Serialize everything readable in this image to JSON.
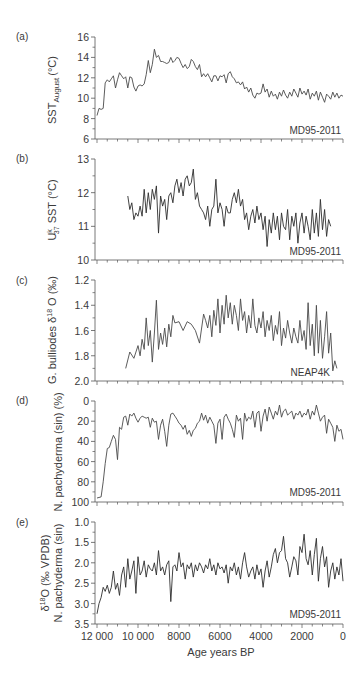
{
  "figure": {
    "xlabel": "Age years BP",
    "x_ticks": [
      12000,
      10000,
      8000,
      6000,
      4000,
      2000,
      0
    ],
    "x_tick_labels": [
      "12 000",
      "10 000",
      "8000",
      "6000",
      "4000",
      "2000",
      "0"
    ],
    "line_color": "#4a4a4a"
  },
  "chart_data": [
    {
      "type": "line",
      "panel": "(a)",
      "title": "",
      "ylabel": "SST August (°C)",
      "ylabel_main": "SST",
      "ylabel_sub": "August",
      "ylabel_unit": "(°C)",
      "core": "MD95-2011",
      "ylim": [
        6,
        16
      ],
      "y_ticks": [
        6,
        8,
        10,
        12,
        14,
        16
      ],
      "y_tick_labels": [
        "6",
        "8",
        "10",
        "12",
        "14",
        "16"
      ],
      "inverted": false,
      "x": [
        12000,
        11900,
        11800,
        11700,
        11600,
        11500,
        11400,
        11300,
        11200,
        11100,
        11000,
        10900,
        10800,
        10700,
        10600,
        10500,
        10400,
        10300,
        10200,
        10100,
        10000,
        9900,
        9800,
        9700,
        9600,
        9500,
        9400,
        9300,
        9200,
        9100,
        9000,
        8900,
        8800,
        8700,
        8600,
        8500,
        8400,
        8300,
        8200,
        8100,
        8000,
        7900,
        7800,
        7700,
        7600,
        7500,
        7400,
        7300,
        7200,
        7100,
        7000,
        6900,
        6800,
        6700,
        6600,
        6500,
        6400,
        6300,
        6200,
        6100,
        6000,
        5900,
        5800,
        5700,
        5600,
        5500,
        5400,
        5300,
        5200,
        5100,
        5000,
        4900,
        4800,
        4700,
        4600,
        4500,
        4400,
        4300,
        4200,
        4100,
        4000,
        3900,
        3800,
        3700,
        3600,
        3500,
        3400,
        3300,
        3200,
        3100,
        3000,
        2900,
        2800,
        2700,
        2600,
        2500,
        2400,
        2300,
        2200,
        2100,
        2000,
        1900,
        1800,
        1700,
        1600,
        1500,
        1400,
        1300,
        1200,
        1100,
        1000,
        900,
        800,
        700,
        600,
        500,
        400,
        300,
        200,
        100,
        0
      ],
      "values": [
        8.3,
        9.0,
        8.9,
        9.0,
        11.5,
        11.8,
        11.6,
        11.9,
        12.2,
        11.0,
        11.8,
        12.5,
        12.2,
        11.9,
        12.1,
        11.0,
        12.1,
        12.0,
        11.1,
        10.7,
        11.2,
        11.3,
        11.2,
        11.4,
        12.3,
        13.7,
        12.5,
        13.3,
        14.8,
        14.0,
        14.2,
        13.6,
        13.6,
        13.5,
        13.4,
        13.5,
        14.0,
        13.5,
        13.7,
        14.0,
        13.9,
        13.4,
        13.0,
        13.3,
        12.9,
        13.1,
        13.8,
        13.6,
        13.1,
        12.8,
        13.3,
        12.1,
        12.4,
        12.1,
        12.4,
        12.0,
        11.6,
        12.2,
        12.2,
        11.7,
        12.2,
        12.1,
        12.3,
        11.5,
        12.4,
        12.6,
        12.1,
        11.9,
        11.5,
        11.6,
        11.3,
        11.6,
        10.9,
        11.1,
        10.6,
        11.0,
        10.3,
        10.0,
        10.5,
        10.4,
        10.5,
        11.4,
        10.6,
        10.9,
        10.1,
        10.7,
        10.2,
        10.4,
        9.9,
        10.6,
        10.2,
        10.8,
        10.3,
        10.0,
        10.6,
        10.2,
        10.9,
        10.5,
        10.1,
        11.0,
        10.4,
        10.7,
        10.3,
        10.9,
        9.9,
        10.5,
        10.2,
        10.7,
        9.8,
        10.6,
        10.1,
        9.6,
        10.4,
        10.2,
        9.9,
        10.6,
        10.1,
        10.5,
        10.0,
        10.3,
        10.2
      ]
    },
    {
      "type": "line",
      "panel": "(b)",
      "title": "",
      "ylabel": "Uk37 SST (°C)",
      "ylabel_main": "U",
      "ylabel_sup": "k",
      "ylabel_sub": "37",
      "ylabel_rest": " SST (°C)",
      "core": "MD95-2011",
      "ylim": [
        10,
        13
      ],
      "y_ticks": [
        10,
        11,
        12,
        13
      ],
      "y_tick_labels": [
        "10",
        "11",
        "12",
        "13"
      ],
      "inverted": false,
      "x": [
        10500,
        10400,
        10300,
        10200,
        10100,
        10000,
        9900,
        9800,
        9700,
        9600,
        9500,
        9400,
        9300,
        9200,
        9100,
        9000,
        8900,
        8800,
        8700,
        8600,
        8500,
        8400,
        8300,
        8200,
        8100,
        8000,
        7900,
        7800,
        7700,
        7600,
        7500,
        7400,
        7300,
        7200,
        7100,
        7000,
        6900,
        6800,
        6700,
        6600,
        6500,
        6400,
        6300,
        6200,
        6100,
        6000,
        5900,
        5800,
        5700,
        5600,
        5500,
        5400,
        5300,
        5200,
        5100,
        5000,
        4900,
        4800,
        4700,
        4600,
        4500,
        4400,
        4300,
        4200,
        4100,
        4000,
        3900,
        3800,
        3700,
        3600,
        3500,
        3400,
        3300,
        3200,
        3100,
        3000,
        2900,
        2800,
        2700,
        2600,
        2500,
        2400,
        2300,
        2200,
        2100,
        2000,
        1900,
        1800,
        1700,
        1600,
        1500,
        1400,
        1300,
        1200,
        1100,
        1000,
        900,
        800,
        700,
        600
      ],
      "values": [
        11.9,
        11.5,
        11.7,
        11.2,
        11.4,
        11.3,
        11.6,
        11.3,
        12.1,
        11.4,
        12.0,
        11.5,
        12.1,
        11.8,
        12.2,
        10.8,
        11.9,
        11.6,
        11.8,
        11.2,
        11.9,
        12.0,
        11.7,
        12.2,
        12.4,
        12.0,
        12.3,
        11.9,
        12.4,
        12.5,
        12.2,
        12.3,
        12.7,
        11.8,
        12.0,
        11.6,
        11.5,
        11.4,
        11.2,
        11.6,
        11.0,
        11.5,
        11.6,
        12.4,
        11.4,
        11.7,
        11.5,
        11.0,
        11.6,
        11.4,
        11.4,
        11.8,
        12.0,
        11.7,
        12.1,
        11.6,
        11.8,
        11.2,
        11.4,
        10.9,
        11.3,
        11.5,
        11.1,
        11.6,
        11.2,
        11.4,
        10.9,
        11.3,
        10.4,
        11.2,
        10.8,
        11.4,
        10.9,
        11.3,
        10.6,
        11.4,
        11.0,
        10.9,
        11.5,
        10.6,
        11.3,
        11.0,
        11.4,
        10.5,
        11.1,
        11.4,
        10.8,
        11.3,
        11.0,
        10.6,
        11.5,
        10.8,
        11.4,
        10.7,
        11.8,
        10.9,
        11.5,
        10.7,
        11.2,
        11.0
      ]
    },
    {
      "type": "line",
      "panel": "(c)",
      "title": "",
      "ylabel": "G. bulliodes δ18O (‰)",
      "ylabel_main": "G. bulliodes δ",
      "ylabel_sup": "18",
      "ylabel_rest": " O (‰)",
      "core": "NEAP4K",
      "ylim": [
        2.0,
        1.2
      ],
      "y_ticks": [
        1.2,
        1.4,
        1.6,
        1.8,
        2.0
      ],
      "y_tick_labels": [
        "1.2",
        "1.4",
        "1.6",
        "1.8",
        "2.0"
      ],
      "inverted": true,
      "x": [
        10600,
        10400,
        10200,
        10000,
        9900,
        9800,
        9700,
        9600,
        9500,
        9400,
        9300,
        9200,
        9100,
        9000,
        8900,
        8800,
        8700,
        8600,
        8500,
        8400,
        8300,
        8200,
        8000,
        7800,
        7600,
        7400,
        7200,
        7000,
        6800,
        6700,
        6600,
        6500,
        6400,
        6300,
        6200,
        6100,
        6000,
        5900,
        5800,
        5700,
        5600,
        5500,
        5400,
        5300,
        5200,
        5100,
        5000,
        4900,
        4800,
        4700,
        4600,
        4500,
        4400,
        4300,
        4200,
        4100,
        4000,
        3900,
        3800,
        3700,
        3600,
        3500,
        3400,
        3300,
        3200,
        3100,
        3000,
        2900,
        2800,
        2700,
        2600,
        2500,
        2400,
        2300,
        2200,
        2100,
        2000,
        1900,
        1800,
        1700,
        1600,
        1500,
        1400,
        1300,
        1200,
        1100,
        1000,
        900,
        800,
        700,
        600,
        500,
        400,
        300
      ],
      "values": [
        1.9,
        1.77,
        1.82,
        1.72,
        1.8,
        1.67,
        1.75,
        1.5,
        1.72,
        1.6,
        1.85,
        1.62,
        1.36,
        1.75,
        1.62,
        1.71,
        1.58,
        1.73,
        1.55,
        1.65,
        1.48,
        1.54,
        1.53,
        1.6,
        1.53,
        1.55,
        1.6,
        1.7,
        1.47,
        1.52,
        1.58,
        1.48,
        1.65,
        1.44,
        1.56,
        1.35,
        1.62,
        1.4,
        1.55,
        1.32,
        1.5,
        1.38,
        1.55,
        1.4,
        1.48,
        1.6,
        1.35,
        1.52,
        1.45,
        1.62,
        1.48,
        1.58,
        1.35,
        1.56,
        1.62,
        1.5,
        1.58,
        1.45,
        1.65,
        1.52,
        1.6,
        1.48,
        1.68,
        1.56,
        1.63,
        1.45,
        1.72,
        1.58,
        1.66,
        1.52,
        1.62,
        1.7,
        1.58,
        1.65,
        1.7,
        1.52,
        1.68,
        1.6,
        1.75,
        1.38,
        1.72,
        1.55,
        1.8,
        1.4,
        1.78,
        1.52,
        1.82,
        1.65,
        1.45,
        1.78,
        1.62,
        1.92,
        1.84,
        1.9
      ]
    },
    {
      "type": "line",
      "panel": "(d)",
      "title": "",
      "ylabel": "N. pachyderma (sin) (%)",
      "core": "MD95-2011",
      "ylim": [
        100,
        0
      ],
      "y_ticks": [
        0,
        20,
        40,
        60,
        80,
        100
      ],
      "y_tick_labels": [
        "0",
        "20",
        "40",
        "60",
        "80",
        "100"
      ],
      "inverted": true,
      "x": [
        12000,
        11800,
        11700,
        11600,
        11500,
        11400,
        11300,
        11200,
        11100,
        11000,
        10900,
        10800,
        10700,
        10600,
        10500,
        10400,
        10300,
        10200,
        10100,
        10000,
        9900,
        9800,
        9700,
        9600,
        9500,
        9400,
        9300,
        9200,
        9100,
        9000,
        8900,
        8800,
        8700,
        8600,
        8500,
        8400,
        8300,
        8200,
        8100,
        8000,
        7900,
        7800,
        7700,
        7600,
        7500,
        7400,
        7300,
        7200,
        7100,
        7000,
        6900,
        6800,
        6700,
        6600,
        6500,
        6400,
        6300,
        6200,
        6100,
        6000,
        5900,
        5800,
        5700,
        5600,
        5500,
        5400,
        5300,
        5200,
        5100,
        5000,
        4900,
        4800,
        4700,
        4600,
        4500,
        4400,
        4300,
        4200,
        4100,
        4000,
        3900,
        3800,
        3700,
        3600,
        3500,
        3400,
        3300,
        3200,
        3100,
        3000,
        2900,
        2800,
        2700,
        2600,
        2500,
        2400,
        2300,
        2200,
        2100,
        2000,
        1900,
        1800,
        1700,
        1600,
        1500,
        1400,
        1300,
        1200,
        1100,
        1000,
        900,
        800,
        700,
        600,
        500,
        400,
        300,
        200,
        100,
        0
      ],
      "values": [
        96,
        95,
        80,
        62,
        47,
        46,
        40,
        34,
        38,
        58,
        26,
        28,
        16,
        15,
        24,
        13,
        15,
        12,
        17,
        21,
        17,
        15,
        16,
        17,
        16,
        26,
        17,
        21,
        20,
        38,
        24,
        18,
        30,
        45,
        24,
        13,
        12,
        15,
        18,
        22,
        24,
        28,
        24,
        33,
        29,
        35,
        29,
        27,
        22,
        20,
        12,
        19,
        14,
        22,
        16,
        20,
        24,
        42,
        22,
        18,
        38,
        16,
        13,
        18,
        22,
        28,
        36,
        14,
        20,
        17,
        38,
        12,
        20,
        16,
        18,
        10,
        26,
        12,
        10,
        30,
        15,
        8,
        20,
        6,
        12,
        18,
        10,
        14,
        4,
        16,
        10,
        8,
        14,
        12,
        10,
        18,
        12,
        14,
        10,
        16,
        12,
        14,
        8,
        18,
        10,
        14,
        4,
        12,
        20,
        16,
        14,
        32,
        18,
        22,
        26,
        40,
        24,
        30,
        28,
        38
      ]
    },
    {
      "type": "line",
      "panel": "(e)",
      "title": "",
      "ylabel": "δ18O (‰ VPDB) N. pachyderma (sin)",
      "ylabel_line1_main": "δ",
      "ylabel_line1_sup": "18",
      "ylabel_line1_rest": "O (‰ VPDB)",
      "ylabel_line2": "N. pachyderma (sin)",
      "core": "MD95-2011",
      "ylim": [
        3.5,
        1.0
      ],
      "y_ticks": [
        1.0,
        1.5,
        2.0,
        2.5,
        3.0,
        3.5
      ],
      "y_tick_labels": [
        "1.0",
        "1.5",
        "2.0",
        "2.5",
        "3.0",
        "3.5"
      ],
      "inverted": true,
      "x": [
        12000,
        11900,
        11800,
        11700,
        11600,
        11500,
        11400,
        11300,
        11200,
        11100,
        11000,
        10900,
        10800,
        10700,
        10600,
        10500,
        10400,
        10300,
        10200,
        10100,
        10000,
        9900,
        9800,
        9700,
        9600,
        9500,
        9400,
        9300,
        9200,
        9100,
        9000,
        8900,
        8800,
        8700,
        8600,
        8500,
        8400,
        8300,
        8200,
        8100,
        8000,
        7900,
        7800,
        7700,
        7600,
        7500,
        7400,
        7300,
        7200,
        7100,
        7000,
        6900,
        6800,
        6700,
        6600,
        6500,
        6400,
        6300,
        6200,
        6100,
        6000,
        5900,
        5800,
        5700,
        5600,
        5500,
        5400,
        5300,
        5200,
        5100,
        5000,
        4900,
        4800,
        4700,
        4600,
        4500,
        4400,
        4300,
        4200,
        4100,
        4000,
        3900,
        3800,
        3700,
        3600,
        3500,
        3400,
        3300,
        3200,
        3100,
        3000,
        2900,
        2800,
        2700,
        2600,
        2500,
        2400,
        2300,
        2200,
        2100,
        2000,
        1900,
        1800,
        1700,
        1600,
        1500,
        1400,
        1300,
        1200,
        1100,
        1000,
        900,
        800,
        700,
        600,
        500,
        400,
        300,
        200,
        100,
        0
      ],
      "values": [
        3.25,
        3.0,
        2.85,
        2.6,
        2.7,
        2.55,
        2.75,
        2.6,
        2.2,
        2.65,
        2.5,
        2.8,
        2.3,
        2.1,
        2.6,
        1.9,
        2.4,
        2.2,
        1.95,
        2.75,
        1.85,
        2.3,
        2.2,
        1.95,
        2.35,
        2.05,
        2.15,
        2.2,
        2.0,
        2.3,
        1.7,
        2.2,
        2.1,
        2.3,
        2.05,
        1.95,
        2.95,
        2.1,
        2.05,
        2.2,
        1.75,
        2.1,
        2.0,
        2.4,
        2.05,
        2.15,
        2.0,
        2.35,
        2.05,
        2.2,
        2.0,
        2.1,
        2.25,
        2.05,
        2.15,
        1.9,
        2.2,
        2.05,
        2.3,
        2.0,
        2.15,
        2.1,
        2.25,
        2.05,
        2.5,
        2.1,
        2.2,
        2.0,
        2.3,
        2.1,
        2.4,
        2.0,
        1.75,
        2.1,
        2.35,
        2.2,
        2.1,
        2.4,
        2.05,
        2.3,
        2.15,
        2.6,
        2.2,
        1.95,
        2.35,
        2.1,
        1.8,
        1.65,
        2.0,
        1.75,
        1.7,
        1.35,
        1.9,
        2.0,
        2.35,
        2.1,
        1.85,
        1.95,
        2.3,
        1.6,
        1.75,
        1.3,
        1.9,
        2.05,
        1.7,
        2.3,
        1.8,
        1.4,
        2.45,
        1.9,
        1.6,
        2.1,
        1.85,
        2.6,
        2.2,
        2.0,
        2.4,
        2.1,
        2.3,
        1.9,
        2.45
      ]
    }
  ]
}
